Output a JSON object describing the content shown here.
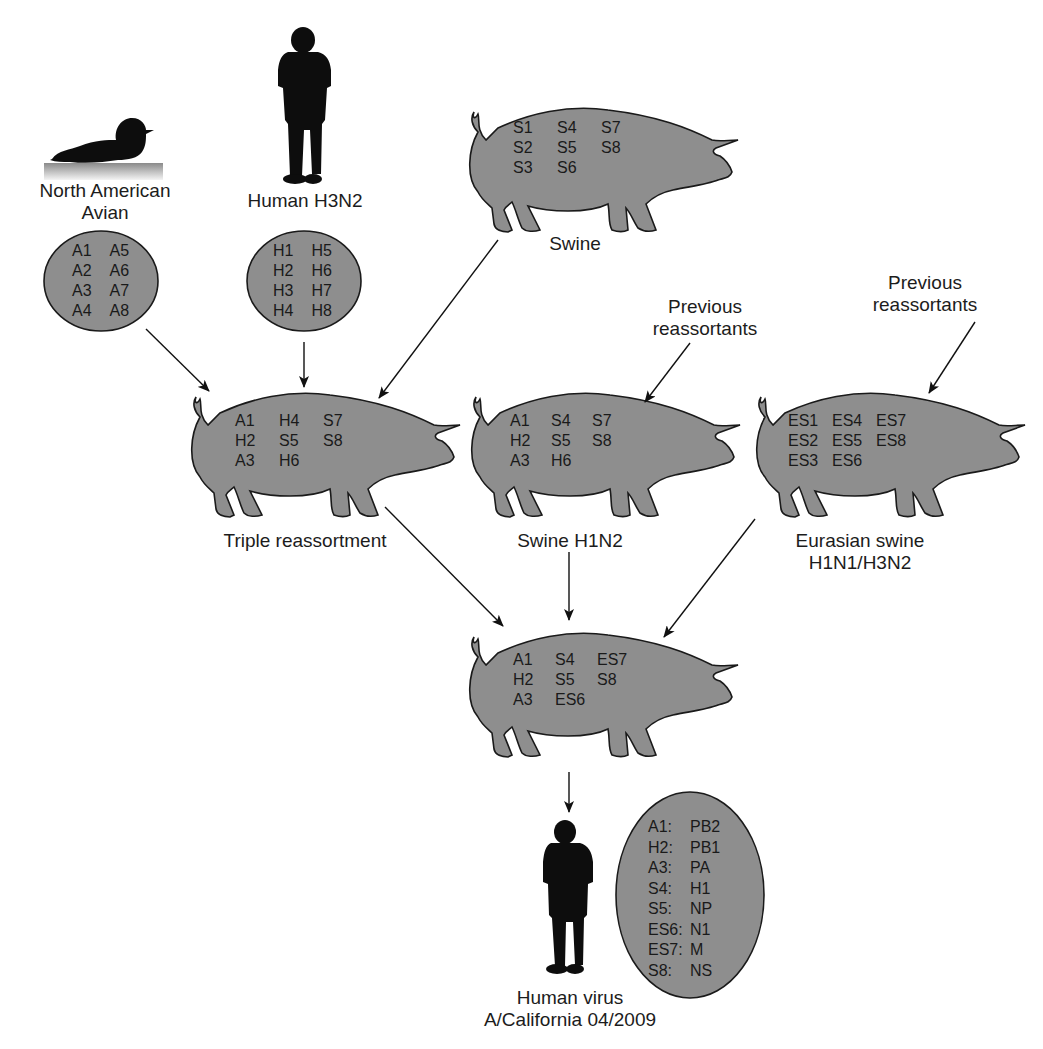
{
  "colors": {
    "fill_gray": "#8e8e8e",
    "outline": "#1a1a1a",
    "silhouette": "#0d0d0d",
    "background": "#ffffff"
  },
  "sources": {
    "avian": {
      "label_line1": "North American",
      "label_line2": "Avian",
      "icon": "duck-icon",
      "segments": [
        "A1",
        "A5",
        "A2",
        "A6",
        "A3",
        "A7",
        "A4",
        "A8"
      ]
    },
    "human_h3n2": {
      "label": "Human H3N2",
      "icon": "human-silhouette-icon",
      "segments": [
        "H1",
        "H5",
        "H2",
        "H6",
        "H3",
        "H7",
        "H4",
        "H8"
      ]
    },
    "swine": {
      "label": "Swine",
      "icon": "pig-icon",
      "segments": [
        "S1",
        "S4",
        "S7",
        "S2",
        "S5",
        "S8",
        "S3",
        "S6",
        ""
      ]
    }
  },
  "intermediates": {
    "triple": {
      "label": "Triple reassortment",
      "segments": [
        "A1",
        "H4",
        "S7",
        "H2",
        "S5",
        "S8",
        "A3",
        "H6",
        ""
      ]
    },
    "swine_h1n2": {
      "label": "Swine H1N2",
      "prev_line1": "Previous",
      "prev_line2": "reassortants",
      "segments": [
        "A1",
        "S4",
        "S7",
        "H2",
        "S5",
        "S8",
        "A3",
        "H6",
        ""
      ]
    },
    "eurasian": {
      "label_line1": "Eurasian swine",
      "label_line2": "H1N1/H3N2",
      "prev_line1": "Previous",
      "prev_line2": "reassortants",
      "segments": [
        "ES1",
        "ES4",
        "ES7",
        "ES2",
        "ES5",
        "ES8",
        "ES3",
        "ES6",
        ""
      ]
    }
  },
  "final_pig": {
    "segments": [
      "A1",
      "S4",
      "ES7",
      "H2",
      "S5",
      "S8",
      "A3",
      "ES6",
      ""
    ]
  },
  "human_virus": {
    "label_line1": "Human virus",
    "label_line2": "A/California 04/2009",
    "legend": [
      {
        "seg": "A1:",
        "gene": "PB2"
      },
      {
        "seg": "H2:",
        "gene": "PB1"
      },
      {
        "seg": "A3:",
        "gene": "PA"
      },
      {
        "seg": "S4:",
        "gene": "H1"
      },
      {
        "seg": "S5:",
        "gene": "NP"
      },
      {
        "seg": "ES6:",
        "gene": "N1"
      },
      {
        "seg": "ES7:",
        "gene": "M"
      },
      {
        "seg": "S8:",
        "gene": "NS"
      }
    ]
  }
}
